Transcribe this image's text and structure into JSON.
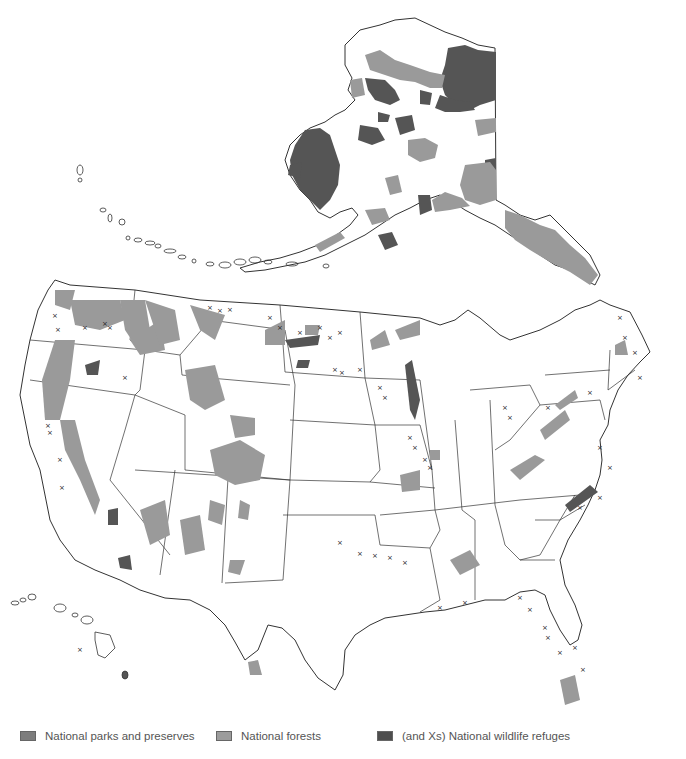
{
  "map": {
    "title": "",
    "regions": [
      "Alaska",
      "Contiguous United States",
      "Hawaii"
    ],
    "colors": {
      "background": "#ffffff",
      "outline": "#333333",
      "parks": "#808080",
      "forests": "#9a9a9a",
      "refuges": "#555555",
      "marker": "#222222"
    },
    "marker_symbol": "×"
  },
  "legend": {
    "items": [
      {
        "label": "National parks and preserves",
        "color": "#7d7d7d"
      },
      {
        "label": "National forests",
        "color": "#9c9c9c"
      },
      {
        "label": "(and Xs) National wildlife refuges",
        "color": "#4e4e4e"
      }
    ]
  }
}
